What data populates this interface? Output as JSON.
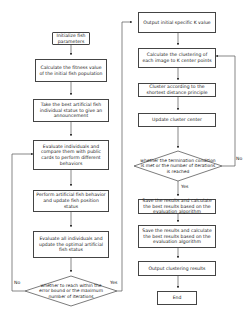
{
  "left_column": {
    "nodes": [
      {
        "id": "init",
        "text": "Initialize fish parameters"
      },
      {
        "id": "fitness",
        "text": "Calculate the fitness value of the initial fish population"
      },
      {
        "id": "best",
        "text": "Take the best artificial fish individual status to give an announcement"
      },
      {
        "id": "evaluate",
        "text": "Evaluate individuals and compare them with public cards to perform different behaviors"
      },
      {
        "id": "perform",
        "text": "Perform artificial fish behavior and update fish position status"
      },
      {
        "id": "evalall",
        "text": "Evaluate all individuals and update the optimal artificial fish status"
      }
    ],
    "decision": {
      "text": "whether to reach within the error bound or the maximum number of iterations",
      "yes_label": "Yes",
      "no_label": "No"
    }
  },
  "right_column": {
    "nodes": [
      {
        "id": "outk",
        "text": "Output initial specific K value"
      },
      {
        "id": "calcclust",
        "text": "Calculate the clustering of each image to K center points"
      },
      {
        "id": "cluster",
        "text": "Cluster according to the shortest distance principle"
      },
      {
        "id": "update",
        "text": "Update cluster center"
      },
      {
        "id": "save1",
        "text": "Save the results and calculate the best results based on the evaluation algorithm"
      },
      {
        "id": "save2",
        "text": "Save the results and calculate the best results based on the evaluation algorithm"
      },
      {
        "id": "output",
        "text": "Output clustering results"
      },
      {
        "id": "end",
        "text": "End"
      }
    ],
    "decision": {
      "text": "whether the termination condition is met or the number of iterations is reached",
      "yes_label": "Yes",
      "no_label": "No"
    }
  },
  "colors": {
    "stroke": "#444444",
    "text": "#222222",
    "background": "#ffffff"
  }
}
